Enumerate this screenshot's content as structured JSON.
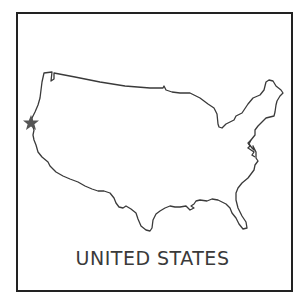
{
  "card": {
    "title": "UNITED STATES",
    "outline_color": "#3a3a3a",
    "frame_color": "#222222",
    "marker": {
      "icon": "star-icon",
      "color": "#555555",
      "location": "Northern California coast"
    }
  }
}
